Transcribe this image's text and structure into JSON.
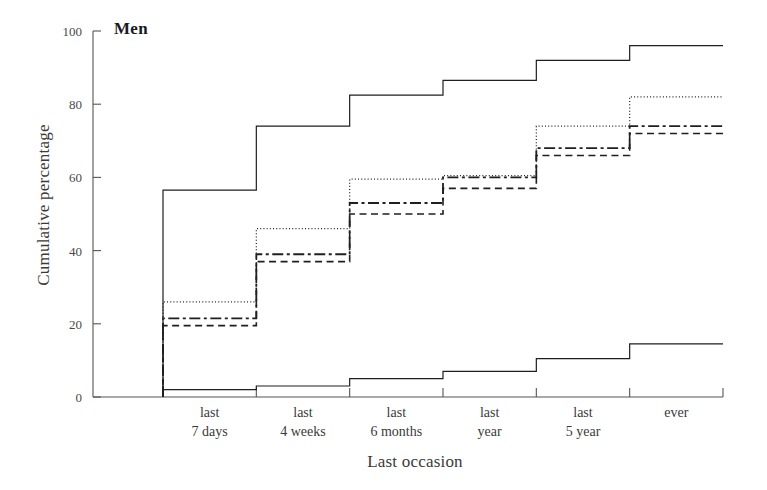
{
  "panel": {
    "title": "Men"
  },
  "chart_data": {
    "type": "line",
    "subtype": "step",
    "title": "Men",
    "xlabel": "Last occasion",
    "ylabel": "Cumulative percentage",
    "categories": [
      "last 7 days",
      "last 4 weeks",
      "last 6 months",
      "last year",
      "last 5 year",
      "ever"
    ],
    "category_lines": [
      [
        "last",
        "7 days"
      ],
      [
        "last",
        "4 weeks"
      ],
      [
        "last",
        "6 months"
      ],
      [
        "last",
        "year"
      ],
      [
        "last",
        "5 year"
      ],
      [
        "ever",
        ""
      ]
    ],
    "ylim": [
      0,
      100
    ],
    "yticks": [
      0,
      20,
      40,
      60,
      80,
      100
    ],
    "ytick_labels": [
      "0",
      "20",
      "40",
      "60",
      "80",
      "100"
    ],
    "grid": false,
    "legend": "none",
    "series": [
      {
        "name": "series-1",
        "style": "solid",
        "values": [
          56.5,
          74.0,
          82.5,
          86.5,
          92.0,
          96.0
        ]
      },
      {
        "name": "series-2",
        "style": "dotted",
        "values": [
          26.0,
          46.0,
          59.5,
          60.5,
          74.0,
          82.0
        ]
      },
      {
        "name": "series-3",
        "style": "dash-dot",
        "values": [
          21.5,
          39.0,
          53.0,
          60.0,
          68.0,
          74.0
        ]
      },
      {
        "name": "series-4",
        "style": "dashed",
        "values": [
          19.5,
          37.0,
          50.0,
          57.0,
          66.0,
          72.0
        ]
      },
      {
        "name": "series-5",
        "style": "solid",
        "values": [
          2.0,
          3.0,
          5.0,
          7.0,
          10.5,
          14.5
        ]
      }
    ],
    "colors": {
      "ink": "#1f1f1f",
      "axis": "#555555",
      "text": "#3a3a3a",
      "background": "#ffffff"
    }
  }
}
